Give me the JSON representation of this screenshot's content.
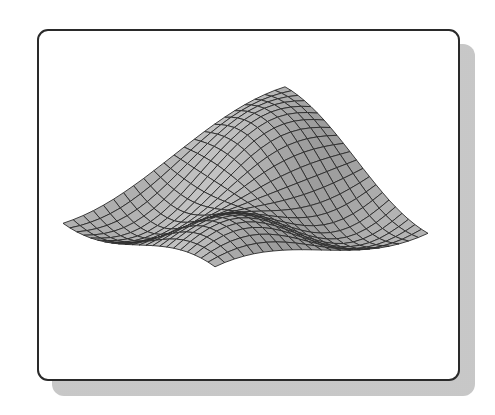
{
  "figure": {
    "mesh": {
      "rows": 22,
      "cols": 22,
      "line_color": "#2b2b2b",
      "fill_light": "#d9d9d9",
      "fill_dark": "#7a7a7a"
    },
    "frame": {
      "border_color": "#2a2a2a",
      "shadow_color": "#d0d0d0"
    },
    "anchors": {
      "left_tip": [
        63,
        185
      ],
      "right_tip": [
        427,
        198
      ],
      "back_left_peak": [
        222,
        50
      ],
      "back_right_peak": [
        360,
        92
      ],
      "front_left_trough": [
        175,
        293
      ],
      "front_bottom_tip": [
        320,
        362
      ]
    }
  }
}
